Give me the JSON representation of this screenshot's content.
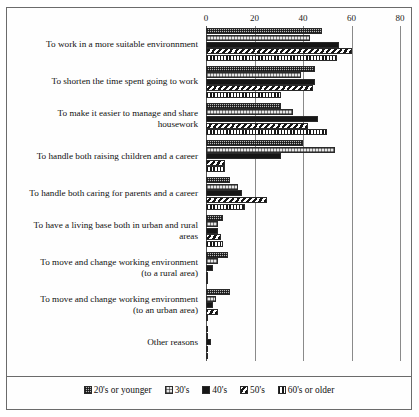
{
  "chart_data": {
    "type": "bar",
    "orientation": "horizontal",
    "title": "",
    "subtitle": "",
    "xlabel": "",
    "ylabel": "",
    "xlim": [
      0,
      80
    ],
    "xticks": [
      0,
      20,
      40,
      60,
      80
    ],
    "xtick_labels": [
      "0",
      "20",
      "40",
      "60",
      "80"
    ],
    "grid": true,
    "grid_axis": "x",
    "legend_position": "bottom",
    "categories": [
      "To work in a more suitable environnment",
      "To shorten the time spent going to work",
      "To make it easier to manage and share housework",
      "To handle both raising children and a career",
      "To handle both caring for parents and a career",
      "To have a living base both in urban and rural areas",
      "To move and change working environment (to a rural area)",
      "To move and change working environment (to an urban area)",
      "Other reasons"
    ],
    "series": [
      {
        "name": "20's or younger",
        "pattern": "p-20",
        "values": [
          48,
          45,
          31,
          40,
          10,
          7,
          9,
          10,
          1
        ]
      },
      {
        "name": "30's",
        "pattern": "p-30",
        "values": [
          43,
          39,
          36,
          53,
          13,
          5,
          5,
          4,
          1
        ]
      },
      {
        "name": "40's",
        "pattern": "p-40",
        "values": [
          55,
          45,
          46,
          31,
          15,
          5,
          3,
          3,
          2
        ]
      },
      {
        "name": "50's",
        "pattern": "p-50",
        "values": [
          60,
          44,
          42,
          8,
          25,
          6,
          1,
          5,
          1
        ]
      },
      {
        "name": "60's or older",
        "pattern": "p-60",
        "values": [
          54,
          31,
          50,
          8,
          16,
          7,
          1,
          1,
          1
        ]
      }
    ]
  },
  "category_lines": [
    [
      "To work in a more suitable environnment"
    ],
    [
      "To shorten the time spent going to work"
    ],
    [
      "To make it easier to manage and share",
      "housework"
    ],
    [
      "To handle both raising children and a career"
    ],
    [
      "To handle both caring for parents and a career"
    ],
    [
      "To have a living base both in urban and rural",
      "areas"
    ],
    [
      "To move and change working environment",
      "(to a rural area)"
    ],
    [
      "To move and change working environment",
      "(to an urban area)"
    ],
    [
      "Other reasons"
    ]
  ]
}
